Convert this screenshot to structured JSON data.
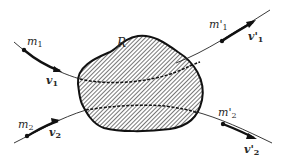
{
  "diagram": {
    "region": {
      "label": "R",
      "fill_pattern": "diagonal-hatch",
      "outline_color": "#111111",
      "hatch_color": "#555555"
    },
    "incoming": [
      {
        "mass": "m",
        "mass_sub": "1",
        "velocity": "v",
        "velocity_sub": "1"
      },
      {
        "mass": "m",
        "mass_sub": "2",
        "velocity": "v",
        "velocity_sub": "2"
      }
    ],
    "outgoing": [
      {
        "mass": "m'",
        "mass_sub": "1",
        "velocity": "v'",
        "velocity_sub": "1"
      },
      {
        "mass": "m'",
        "mass_sub": "2",
        "velocity": "v'",
        "velocity_sub": "2"
      }
    ],
    "colors": {
      "line": "#222222",
      "text": "#2a2a2a",
      "background": "#ffffff"
    }
  }
}
